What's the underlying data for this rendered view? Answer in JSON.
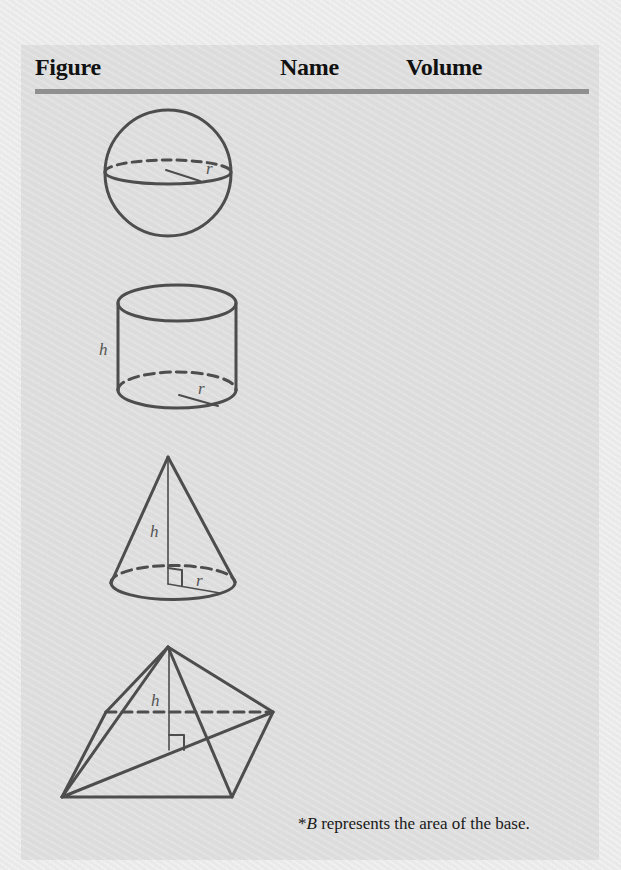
{
  "table": {
    "headers": {
      "figure": "Figure",
      "name": "Name",
      "volume": "Volume"
    },
    "rows": [
      {
        "figure": "sphere",
        "labels": {
          "radius": "r"
        },
        "name": "",
        "volume": ""
      },
      {
        "figure": "cylinder",
        "labels": {
          "height": "h",
          "radius": "r"
        },
        "name": "",
        "volume": ""
      },
      {
        "figure": "cone",
        "labels": {
          "height": "h",
          "radius": "r"
        },
        "name": "",
        "volume": ""
      },
      {
        "figure": "pyramid",
        "labels": {
          "height": "h"
        },
        "name": "",
        "volume": ""
      }
    ]
  },
  "footnote": {
    "asterisk": "*",
    "variable": "B",
    "text": " represents the area of the base."
  },
  "colors": {
    "page_background": "#ededed",
    "box_background": "#dfdfdf",
    "header_rule": "#8f8f8f",
    "figure_stroke": "#4d4d4d",
    "header_text": "#111111"
  }
}
